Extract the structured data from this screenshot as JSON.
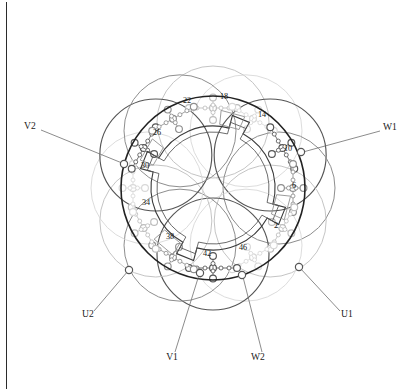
{
  "figure": {
    "type": "motor-stator-winding-diagram",
    "center": {
      "x": 213,
      "y": 188
    },
    "stator": {
      "outer_radius": 92,
      "inner_radius": 62,
      "bore_radius": 46,
      "notch_count": 4
    }
  },
  "colors": {
    "core_dark": "#222222",
    "coil_dark": "#555555",
    "coil_mid": "#8e8e8e",
    "coil_light": "#bdbdbd",
    "coil_faint": "#d8d8d8",
    "label_text": "#1a1a1a",
    "leader_line": "#6e6e6e",
    "frame_border": "#2b2b2b",
    "background": "#ffffff"
  },
  "slot_labels": [
    {
      "text": "2",
      "x": 276,
      "y": 228,
      "angle_deg": 15
    },
    {
      "text": "6",
      "x": 294,
      "y": 188,
      "angle_deg": 345
    },
    {
      "text": "10",
      "x": 288,
      "y": 151,
      "angle_deg": 315
    },
    {
      "text": "14",
      "x": 262,
      "y": 117,
      "angle_deg": 285
    },
    {
      "text": "18",
      "x": 224,
      "y": 99,
      "angle_deg": 262
    },
    {
      "text": "22",
      "x": 187,
      "y": 103,
      "angle_deg": 240
    },
    {
      "text": "26",
      "x": 157,
      "y": 135,
      "angle_deg": 210
    },
    {
      "text": "30",
      "x": 145,
      "y": 168,
      "angle_deg": 185
    },
    {
      "text": "34",
      "x": 146,
      "y": 205,
      "angle_deg": 160
    },
    {
      "text": "38",
      "x": 170,
      "y": 239,
      "angle_deg": 130
    },
    {
      "text": "42",
      "x": 207,
      "y": 256,
      "angle_deg": 100
    },
    {
      "text": "46",
      "x": 243,
      "y": 250,
      "angle_deg": 75
    }
  ],
  "terminals": [
    {
      "name": "V2",
      "text": "V2",
      "label": {
        "x": 24,
        "y": 129
      },
      "leader": {
        "x1": 41,
        "y1": 130,
        "x2": 122,
        "y2": 163
      },
      "node": {
        "x": 124,
        "y": 164
      }
    },
    {
      "name": "W1",
      "text": "W1",
      "label": {
        "x": 383,
        "y": 130
      },
      "leader": {
        "x1": 380,
        "y1": 131,
        "x2": 303,
        "y2": 152
      },
      "node": {
        "x": 301,
        "y": 152
      }
    },
    {
      "name": "U2",
      "text": "U2",
      "label": {
        "x": 82,
        "y": 317
      },
      "leader": {
        "x1": 94,
        "y1": 311,
        "x2": 128,
        "y2": 271
      },
      "node": {
        "x": 129,
        "y": 270
      }
    },
    {
      "name": "U1",
      "text": "U1",
      "label": {
        "x": 341,
        "y": 317
      },
      "leader": {
        "x1": 340,
        "y1": 311,
        "x2": 300,
        "y2": 268
      },
      "node": {
        "x": 299,
        "y": 267
      }
    },
    {
      "name": "V1",
      "text": "V1",
      "label": {
        "x": 172,
        "y": 360
      },
      "leader": {
        "x1": 175,
        "y1": 352,
        "x2": 199,
        "y2": 275
      },
      "node": {
        "x": 200,
        "y": 273
      }
    },
    {
      "name": "W2",
      "text": "W2",
      "label": {
        "x": 258,
        "y": 360
      },
      "leader": {
        "x1": 262,
        "y1": 352,
        "x2": 243,
        "y2": 277
      },
      "node": {
        "x": 242,
        "y": 275
      }
    }
  ],
  "coil_arcs": {
    "count": 12,
    "radius": 56,
    "orbit_radius": 66,
    "shades": [
      "#555555",
      "#8e8e8e",
      "#bdbdbd",
      "#d8d8d8"
    ],
    "note": "Twelve overlapping coil-span circles arranged around the stator, drawn in four grey tones for the three phases and their return legs"
  },
  "conductor_chains": {
    "count": 12,
    "big_node_radius": 3.4,
    "small_node_radius": 2.0,
    "note": "Chains of alternating large and small circles represent end-winding conductors linking coil sides"
  }
}
